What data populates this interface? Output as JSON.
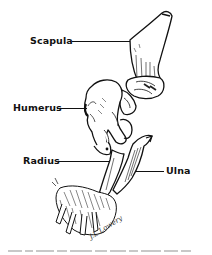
{
  "figure": {
    "labels": [
      {
        "id": "scapula",
        "text": "Scapula"
      },
      {
        "id": "humerus",
        "text": "Humerus"
      },
      {
        "id": "radius",
        "text": "Radius"
      },
      {
        "id": "ulna",
        "text": "Ulna"
      }
    ],
    "signature": "J.L.Lowery",
    "colors": {
      "ink": "#111111",
      "background": "#ffffff"
    }
  }
}
